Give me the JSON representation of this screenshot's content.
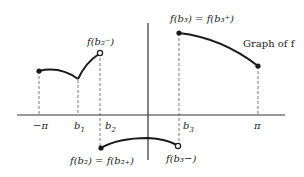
{
  "diagram": {
    "title": "Graph of f",
    "axis_labels": {
      "neg_pi": "−π",
      "b1": "b",
      "b1_sub": "1",
      "b2": "b",
      "b2_sub": "2",
      "b3": "b",
      "b3_sub": "3",
      "pi": "π"
    },
    "annotations": {
      "f_b2_minus": "f(b₂⁻)",
      "f_b3_eq": "f(b₃) = f(b₃⁺)",
      "f_b2_eq": "f(b₂) = f(b₂₊)",
      "f_b3_minus": "f(b₃−)",
      "graph_label": "Graph of f"
    },
    "points": [
      {
        "name": "start-neg-pi",
        "x": 39,
        "y": 71,
        "type": "filled"
      },
      {
        "name": "b2-left-limit",
        "x": 100,
        "y": 53,
        "type": "open"
      },
      {
        "name": "b2-value",
        "x": 101,
        "y": 148,
        "type": "filled"
      },
      {
        "name": "b3-left-limit",
        "x": 178,
        "y": 146,
        "type": "open"
      },
      {
        "name": "b3-value",
        "x": 178,
        "y": 33,
        "type": "filled"
      },
      {
        "name": "end-pi",
        "x": 258,
        "y": 66,
        "type": "filled"
      }
    ],
    "colors": {
      "curve": "#1a1a1a",
      "axis": "#333333",
      "dashed": "#555555"
    }
  }
}
